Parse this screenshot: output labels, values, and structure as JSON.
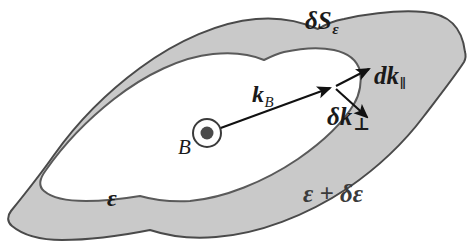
{
  "figure": {
    "width": 473,
    "height": 243,
    "background_color": "#ffffff"
  },
  "colors": {
    "band_fill": "#c9c9c9",
    "outline": "#4a4a4a",
    "inner_outline": "#5a5a5a",
    "arrow": "#111111",
    "text": "#1a1a1a",
    "text_muted": "#3b3b3b"
  },
  "labels": {
    "delta_S_epsilon": {
      "main": "δS",
      "subscript": "ε",
      "meaning": "area element of the orbit on the energy surface"
    },
    "dk_parallel": {
      "main": "dk",
      "subscript": "‖",
      "meaning": "element of length along the orbit"
    },
    "delta_k_perp": {
      "main": "δk",
      "subscript": "⊥",
      "meaning": "normal separation between the two energy contours"
    },
    "k_B": {
      "main": "k",
      "subscript": "B",
      "meaning": "wavevector from the orbit centre to the orbit"
    },
    "B_field": {
      "main": "B",
      "meaning": "magnetic field directed out of the page"
    },
    "epsilon_inner": {
      "main": "ε",
      "meaning": "inner constant-energy contour"
    },
    "epsilon_outer": {
      "main": "ε + δε",
      "meaning": "outer constant-energy contour"
    }
  },
  "icons": {
    "field_out_of_page": "⊙"
  },
  "geometry": {
    "outer_contour_path": "M 465 52 C 462 26, 448 14, 424 12 C 400 10, 372 13, 344 19 C 333 21, 326 24, 318 29 C 300 21, 278 17, 256 19 C 220 22, 178 40, 140 68 C 106 93, 76 124, 54 155 C 40 175, 24 195, 11 211 C 7 216, 7 222, 12 226 C 24 236, 42 240, 62 240 C 90 240, 120 236, 150 230 C 168 236, 192 239, 216 237 C 258 234, 306 216, 348 188 C 380 166, 406 140, 424 116 C 440 95, 455 76, 464 62 C 466 58, 466 55, 465 52 Z",
    "inner_contour_path": "M 360 71 C 357 60, 348 53, 334 50 C 320 47, 302 48, 284 52 C 276 54, 270 57, 264 60 C 250 54, 232 52, 213 54 C 182 57, 146 74, 114 99 C 86 121, 62 147, 46 170 C 40 178, 38 186, 44 191 C 52 198, 68 201, 86 201 C 104 201, 122 199, 140 196 C 154 200, 172 202, 190 201 C 224 198, 264 182, 298 159 C 324 141, 344 121, 354 104 C 360 94, 362 81, 360 71 Z",
    "k_B_arrow": {
      "x1": 207,
      "y1": 133,
      "x2": 333,
      "y2": 87
    },
    "dk_parallel_arrow": {
      "x1": 336,
      "y1": 85,
      "x2": 372,
      "y2": 67
    },
    "delta_k_perp_arrow": {
      "x1": 336,
      "y1": 88,
      "x2": 370,
      "y2": 119
    },
    "field_marker": {
      "cx": 207,
      "cy": 133,
      "r_outer": 14,
      "r_inner": 6
    }
  }
}
